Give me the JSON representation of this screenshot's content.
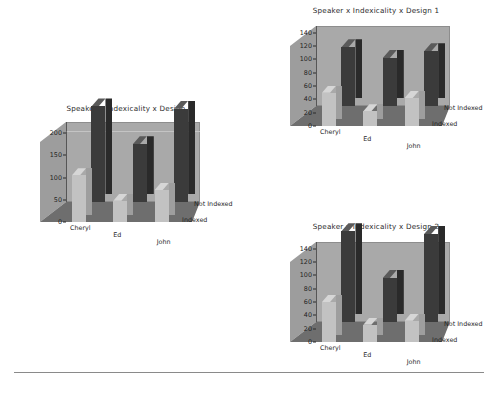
{
  "page": {
    "background": "#ffffff",
    "divider_present": true
  },
  "palette": {
    "wall_back": "#a9a9a9",
    "wall_side": "#9d9d9d",
    "floor": "#6e6e6e",
    "gridline": "#c9c9c9",
    "bar_indexed": "#c2c2c2",
    "bar_indexed_top": "#d6d6d6",
    "bar_indexed_side": "#9e9e9e",
    "bar_not_indexed": "#3b3b3b",
    "bar_not_indexed_top": "#5a5a5a",
    "bar_not_indexed_side": "#2a2a2a",
    "axis": "#2a2a2a",
    "text": "#1f1f1f"
  },
  "legend": {
    "series_back": "Not Indexed",
    "series_front": "Indexed"
  },
  "chart_data": [
    {
      "id": "design-combined",
      "type": "bar",
      "title": "Speaker x Indexicality x Design",
      "xlabel": "",
      "ylabel": "",
      "categories": [
        "Cheryl",
        "Ed",
        "John"
      ],
      "depth_categories": [
        "Indexed",
        "Not Indexed"
      ],
      "series": [
        {
          "name": "Indexed",
          "values": [
            105,
            48,
            72
          ]
        },
        {
          "name": "Not Indexed",
          "values": [
            215,
            130,
            210
          ]
        }
      ],
      "yticks": [
        0,
        50,
        100,
        150,
        200
      ],
      "ylim": [
        0,
        225
      ],
      "grid": true,
      "legend_position": "right-floor"
    },
    {
      "id": "design-1",
      "type": "bar",
      "title": "Speaker x Indexicality x Design 1",
      "xlabel": "",
      "ylabel": "",
      "categories": [
        "Cheryl",
        "Ed",
        "John"
      ],
      "depth_categories": [
        "Indexed",
        "Not Indexed"
      ],
      "series": [
        {
          "name": "Indexed",
          "values": [
            50,
            22,
            42
          ]
        },
        {
          "name": "Not Indexed",
          "values": [
            88,
            72,
            82
          ]
        }
      ],
      "yticks": [
        0,
        20,
        40,
        60,
        80,
        100,
        120,
        140
      ],
      "ylim": [
        0,
        150
      ],
      "grid": false,
      "legend_position": "right-floor"
    },
    {
      "id": "design-2",
      "type": "bar",
      "title": "Speaker x Indexicality x Design 2",
      "xlabel": "",
      "ylabel": "",
      "categories": [
        "Cheryl",
        "Ed",
        "John"
      ],
      "depth_categories": [
        "Indexed",
        "Not Indexed"
      ],
      "series": [
        {
          "name": "Indexed",
          "values": [
            60,
            26,
            32
          ]
        },
        {
          "name": "Not Indexed",
          "values": [
            136,
            66,
            132
          ]
        }
      ],
      "yticks": [
        0,
        20,
        40,
        60,
        80,
        100,
        120,
        140
      ],
      "ylim": [
        0,
        150
      ],
      "grid": false,
      "legend_position": "right-floor"
    }
  ],
  "layout": [
    {
      "id": "design-combined",
      "x": 10,
      "y": 104,
      "w": 232,
      "h": 150,
      "plot": {
        "x": 30,
        "y": 18,
        "w": 160,
        "h": 100
      }
    },
    {
      "id": "design-1",
      "x": 258,
      "y": 6,
      "w": 236,
      "h": 152,
      "plot": {
        "x": 32,
        "y": 20,
        "w": 160,
        "h": 100
      }
    },
    {
      "id": "design-2",
      "x": 258,
      "y": 222,
      "w": 236,
      "h": 152,
      "plot": {
        "x": 32,
        "y": 20,
        "w": 160,
        "h": 100
      }
    }
  ]
}
